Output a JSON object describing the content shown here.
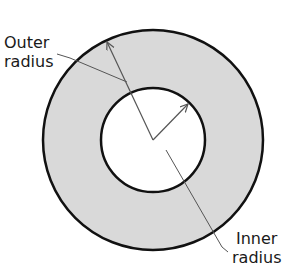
{
  "diagram": {
    "type": "annulus",
    "labels": {
      "outer_line1": "Outer",
      "outer_line2": "radius",
      "inner_line1": "Inner",
      "inner_line2": "radius"
    },
    "colors": {
      "ring_fill": "#d9d9d9",
      "stroke": "#111111",
      "leader": "#555555"
    }
  }
}
